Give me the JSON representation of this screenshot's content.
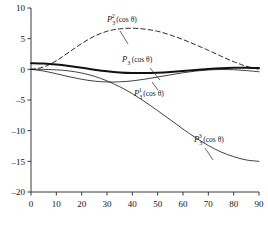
{
  "figure": {
    "title": "",
    "background": "#ffffff",
    "axis_color": "#3b3b3b",
    "curve_color": "#111111"
  },
  "axes": {
    "x": {
      "label": "",
      "min": 0,
      "max": 90,
      "ticks": [
        0,
        10,
        20,
        30,
        40,
        50,
        60,
        70,
        80,
        90
      ],
      "ticklabels": [
        "0",
        "10",
        "20",
        "30",
        "40",
        "50",
        "60",
        "70",
        "80",
        "90"
      ]
    },
    "y": {
      "label": "",
      "min": -20,
      "max": 10,
      "ticks": [
        10,
        5,
        0,
        -5,
        -10,
        -15,
        -20
      ],
      "ticklabels": [
        "10",
        "5",
        "0",
        "-5",
        "-10",
        "-15",
        "-20"
      ]
    }
  },
  "labels": [
    {
      "id": "label-p3-2",
      "base": "P",
      "sub": "3",
      "sup": "2",
      "arg": "(cos θ)",
      "x": 107,
      "y": 22
    },
    {
      "id": "label-p3-0",
      "base": "P",
      "sub": "3",
      "sup": "",
      "arg": "(cos θ)",
      "x": 122,
      "y": 62
    },
    {
      "id": "label-p3-1",
      "base": "P",
      "sub": "3",
      "sup": "1",
      "arg": "(cos θ)",
      "x": 134,
      "y": 96
    },
    {
      "id": "label-p3-3",
      "base": "P",
      "sub": "3",
      "sup": "3",
      "arg": "(cos θ)",
      "x": 194,
      "y": 142
    }
  ],
  "chart_data": {
    "type": "line",
    "title": "",
    "xlabel": "",
    "ylabel": "",
    "xlim": [
      0,
      90
    ],
    "ylim": [
      -20,
      10
    ],
    "grid": false,
    "legend": "inline-annotations",
    "x": [
      0,
      5,
      10,
      15,
      20,
      25,
      30,
      35,
      40,
      45,
      50,
      55,
      60,
      65,
      70,
      75,
      80,
      85,
      90
    ],
    "series": [
      {
        "name": "P_3(cos theta)",
        "label": "P₃(cos θ)",
        "style": "solid-thick",
        "values": [
          1.0,
          0.94,
          0.78,
          0.54,
          0.25,
          -0.05,
          -0.31,
          -0.5,
          -0.6,
          -0.61,
          -0.54,
          -0.42,
          -0.26,
          -0.09,
          0.07,
          0.19,
          0.26,
          0.27,
          0.22
        ]
      },
      {
        "name": "P_3^1(cos theta)",
        "label": "P₃¹(cos θ)",
        "style": "solid-thin",
        "values": [
          0.0,
          -0.28,
          -0.72,
          -1.2,
          -1.62,
          -1.92,
          -2.06,
          -2.04,
          -1.88,
          -1.6,
          -1.26,
          -0.9,
          -0.56,
          -0.28,
          -0.1,
          -0.02,
          -0.06,
          -0.2,
          -0.4
        ]
      },
      {
        "name": "P_3^2(cos theta)",
        "label": "P₃²(cos θ)",
        "style": "dashed",
        "values": [
          0.0,
          0.38,
          1.4,
          2.8,
          4.2,
          5.4,
          6.2,
          6.6,
          6.7,
          6.55,
          6.2,
          5.6,
          4.85,
          4.0,
          3.1,
          2.15,
          1.25,
          0.5,
          0.0
        ]
      },
      {
        "name": "P_3^3(cos theta)",
        "label": "P₃³(cos θ)",
        "style": "solid-thin",
        "values": [
          0.0,
          -0.01,
          -0.08,
          -0.26,
          -0.6,
          -1.13,
          -1.88,
          -2.83,
          -3.97,
          -5.3,
          -6.74,
          -8.23,
          -9.74,
          -11.15,
          -12.42,
          -13.47,
          -14.24,
          -14.78,
          -15.0
        ]
      }
    ]
  }
}
